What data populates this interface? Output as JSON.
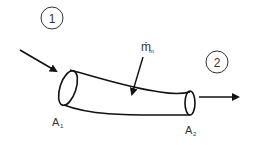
{
  "diagram": {
    "type": "control-volume-pipe",
    "stations": [
      {
        "id": "station-1",
        "label": "1"
      },
      {
        "id": "station-2",
        "label": "2"
      }
    ],
    "mass_flow": {
      "symbol": "ṁ",
      "subscript": "m"
    },
    "areas": [
      {
        "symbol": "A",
        "subscript": "1"
      },
      {
        "symbol": "A",
        "subscript": "2"
      }
    ],
    "colors": {
      "stroke": "#111111",
      "text": "#333333",
      "background": "#ffffff"
    }
  }
}
